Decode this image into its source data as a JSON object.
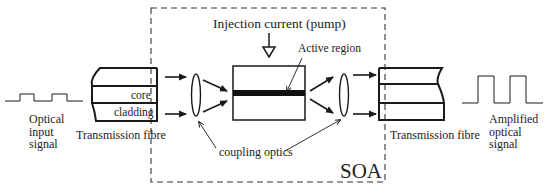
{
  "diagram": {
    "type": "block-diagram",
    "soa_box": {
      "label": "SOA",
      "style": "dashed"
    },
    "injection": {
      "label": "Injection current (pump)"
    },
    "active_region": {
      "label": "Active region"
    },
    "coupling": {
      "label": "coupling optics"
    },
    "input_fibre": {
      "label": "Transmission fibre",
      "layers": {
        "core": "core",
        "cladding": "cladding"
      }
    },
    "output_fibre": {
      "label": "Transmission fibre"
    },
    "input_signal": {
      "lines": [
        "Optical",
        "input",
        "signal"
      ]
    },
    "output_signal": {
      "lines": [
        "Amplified",
        "optical",
        "signal"
      ]
    },
    "colors": {
      "stroke": "#1a1a1a",
      "active_region": "#111111",
      "background": "#ffffff"
    },
    "flow": [
      "Optical input signal",
      "Transmission fibre",
      "coupling optics",
      "SOA active region",
      "coupling optics",
      "Transmission fibre",
      "Amplified optical signal"
    ]
  }
}
